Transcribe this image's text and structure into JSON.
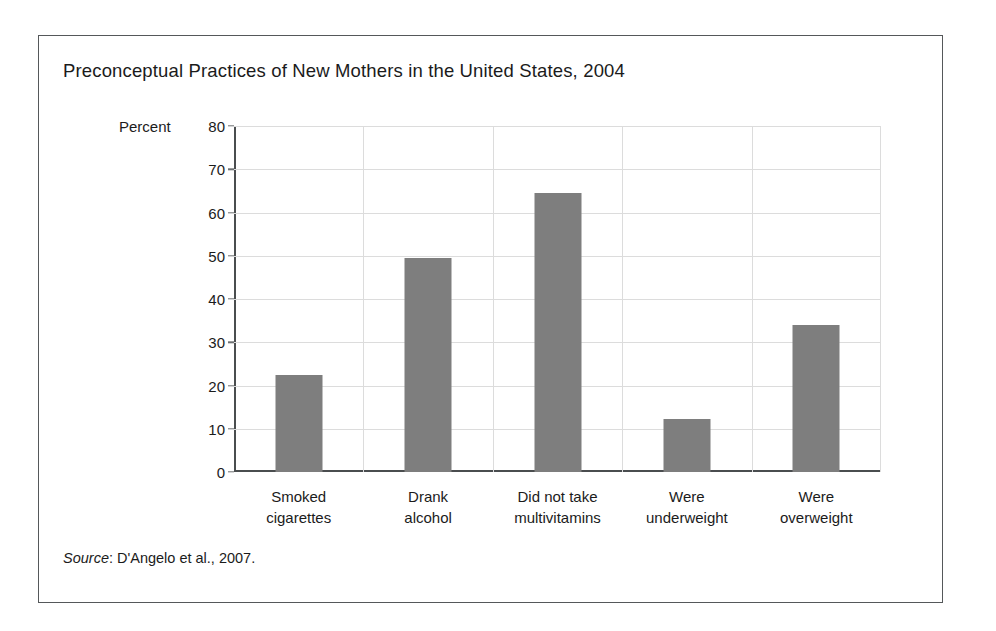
{
  "figure": {
    "title": "Preconceptual Practices of New Mothers in the United States, 2004",
    "source_label": "Source",
    "source_separator": ": ",
    "source_text": "D'Angelo et al., 2007.",
    "frame_color": "#55585a",
    "bar_color": "#7e7e7e",
    "gridline_color": "#dcdcdc",
    "axis_color": "#4a4d4f",
    "background_color": "#ffffff"
  },
  "chart_data": {
    "type": "bar",
    "title": "Preconceptual Practices of New Mothers in the United States, 2004",
    "xlabel": "",
    "ylabel": "Percent",
    "ylim": [
      0,
      80
    ],
    "ytick_step": 10,
    "yticks": [
      0,
      10,
      20,
      30,
      40,
      50,
      60,
      70,
      80
    ],
    "ytick_labels": [
      "0",
      "10",
      "20",
      "30",
      "40",
      "50",
      "60",
      "70",
      "80"
    ],
    "grid": "horizontal-and-vertical",
    "legend": "none",
    "categories": [
      "Smoked cigarettes",
      "Drank alcohol",
      "Did not take multivitamins",
      "Were underweight",
      "Were overweight"
    ],
    "category_lines": [
      [
        "Smoked",
        "cigarettes"
      ],
      [
        "Drank",
        "alcohol"
      ],
      [
        "Did not take",
        "multivitamins"
      ],
      [
        "Were",
        "underweight"
      ],
      [
        "Were",
        "overweight"
      ]
    ],
    "values": [
      22.5,
      49.5,
      64.5,
      12.3,
      34.0
    ],
    "source": "Source: D'Angelo et al., 2007."
  }
}
